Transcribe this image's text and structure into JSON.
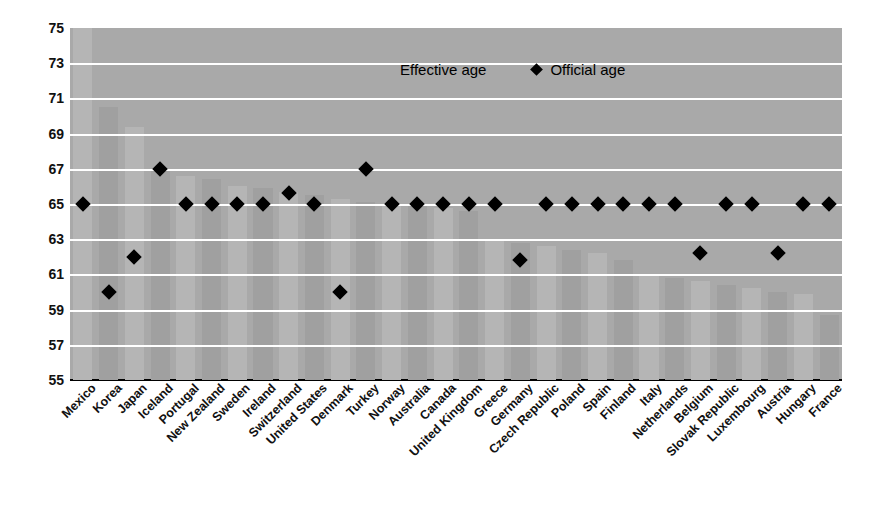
{
  "legend": {
    "series_bar_label": "Effective age",
    "series_marker_label": "Official age",
    "marker_glyph": "diamond-icon"
  },
  "axis": {
    "y_ticks": [
      75,
      73,
      71,
      69,
      67,
      65,
      63,
      61,
      59,
      57,
      55
    ]
  },
  "chart_data": {
    "type": "bar",
    "title": "",
    "subtitle": "",
    "xlabel": "",
    "ylabel": "",
    "ylim": [
      55,
      75
    ],
    "grid": true,
    "legend_position": "top-center",
    "categories": [
      "Mexico",
      "Korea",
      "Japan",
      "Iceland",
      "Portugal",
      "New Zealand",
      "Sweden",
      "Ireland",
      "Switzerland",
      "United States",
      "Denmark",
      "Turkey",
      "Norway",
      "Australia",
      "Canada",
      "United Kingdom",
      "Greece",
      "Germany",
      "Czech Republic",
      "Poland",
      "Spain",
      "Finland",
      "Italy",
      "Netherlands",
      "Belgium",
      "Slovak Republic",
      "Luxembourg",
      "Austria",
      "Hungary",
      "France"
    ],
    "series": [
      {
        "name": "Effective age",
        "type": "bar",
        "values": [
          75.0,
          70.5,
          69.4,
          67.0,
          66.6,
          66.4,
          66.0,
          65.9,
          65.7,
          65.5,
          65.3,
          65.1,
          65.0,
          64.9,
          64.8,
          64.6,
          63.0,
          62.8,
          62.6,
          62.4,
          62.2,
          61.8,
          61.0,
          60.8,
          60.6,
          60.4,
          60.2,
          60.0,
          59.9,
          58.7
        ]
      },
      {
        "name": "Official age",
        "type": "scatter",
        "values": [
          65.0,
          60.0,
          62.0,
          67.0,
          65.0,
          65.0,
          65.0,
          65.0,
          65.6,
          65.0,
          60.0,
          67.0,
          65.0,
          65.0,
          65.0,
          65.0,
          65.0,
          61.8,
          65.0,
          65.0,
          65.0,
          65.0,
          65.0,
          65.0,
          62.2,
          65.0,
          65.0,
          62.2,
          65.0,
          65.0
        ]
      }
    ]
  }
}
